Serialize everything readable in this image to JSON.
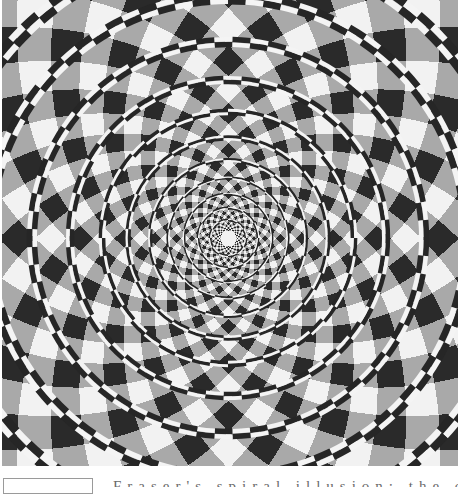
{
  "figure": {
    "center": [
      228,
      238
    ],
    "width": 456,
    "height": 466,
    "colors": {
      "white": "#f2f2f2",
      "light_gray": "#a9a9a9",
      "dark": "#2a2a2a",
      "cord_dark": "#262626",
      "cord_light": "#f4f4f4"
    },
    "rings": [
      18,
      30,
      44,
      60,
      78,
      100,
      126,
      158,
      196,
      240,
      290
    ],
    "wedge_count": 36,
    "twist": 0.55
  },
  "caption": {
    "text": "Fraser's spiral illusion: the concentric circles appear to spiral",
    "legible": false
  }
}
